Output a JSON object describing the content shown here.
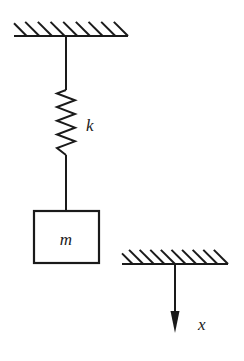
{
  "diagram": {
    "colors": {
      "stroke": "#1a1a1a",
      "background": "#ffffff",
      "label": "#1a1a1a"
    },
    "ceiling": {
      "name": "fixed-support-top",
      "x_start": 14,
      "x_end": 128,
      "baseline_y": 36,
      "hatch_count": 9,
      "hatch_angle_deg": 45,
      "hatch_length": 20
    },
    "spring": {
      "name": "coil-spring",
      "label": "k",
      "axis_x": 66,
      "top_rod_y_start": 36,
      "top_rod_y_end": 90,
      "coil_y_start": 90,
      "coil_y_end": 155,
      "bottom_rod_y_start": 155,
      "bottom_rod_y_end": 211,
      "coil_count": 9,
      "amplitude": 9,
      "label_x": 86,
      "label_y": 131
    },
    "mass": {
      "name": "mass-block",
      "label": "m",
      "x": 34,
      "y": 211,
      "width": 65,
      "height": 52,
      "label_x": 66,
      "label_y": 245
    },
    "reference_support": {
      "name": "fixed-support-right",
      "x_start": 122,
      "x_end": 228,
      "baseline_y": 264,
      "hatch_count": 10,
      "hatch_angle_deg": 45,
      "hatch_length": 20
    },
    "displacement_axis": {
      "name": "displacement-arrow",
      "label": "x",
      "x": 175,
      "y_start": 264,
      "y_end": 333,
      "direction": "down",
      "head_length": 22,
      "head_width": 9,
      "label_x": 198,
      "label_y": 330
    }
  }
}
